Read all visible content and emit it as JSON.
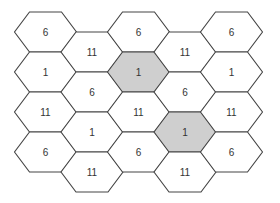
{
  "diagram": {
    "title": "",
    "colors": {
      "stroke": "#444444",
      "fill_normal": "#ffffff",
      "fill_highlight": "#cfcfcf",
      "text": "#333333"
    },
    "geometry": {
      "col_spacing": 46.5,
      "first_col_center_x": 45.5,
      "hex_half_width": 31,
      "hex_top_edge_half": 16,
      "hex_height": 40,
      "first_row_top_y": 12,
      "odd_col_offset_y": 20
    },
    "columns": [
      {
        "cells": [
          {
            "label": "6",
            "highlight": false
          },
          {
            "label": "1",
            "highlight": false
          },
          {
            "label": "11",
            "highlight": false
          },
          {
            "label": "6",
            "highlight": false
          }
        ]
      },
      {
        "cells": [
          {
            "label": "11",
            "highlight": false
          },
          {
            "label": "6",
            "highlight": false
          },
          {
            "label": "1",
            "highlight": false
          },
          {
            "label": "11",
            "highlight": false
          }
        ]
      },
      {
        "cells": [
          {
            "label": "6",
            "highlight": false
          },
          {
            "label": "1",
            "highlight": true
          },
          {
            "label": "11",
            "highlight": false
          },
          {
            "label": "6",
            "highlight": false
          }
        ]
      },
      {
        "cells": [
          {
            "label": "11",
            "highlight": false
          },
          {
            "label": "6",
            "highlight": false
          },
          {
            "label": "1",
            "highlight": true
          },
          {
            "label": "11",
            "highlight": false
          }
        ]
      },
      {
        "cells": [
          {
            "label": "6",
            "highlight": false
          },
          {
            "label": "1",
            "highlight": false
          },
          {
            "label": "11",
            "highlight": false
          },
          {
            "label": "6",
            "highlight": false
          }
        ]
      }
    ]
  }
}
